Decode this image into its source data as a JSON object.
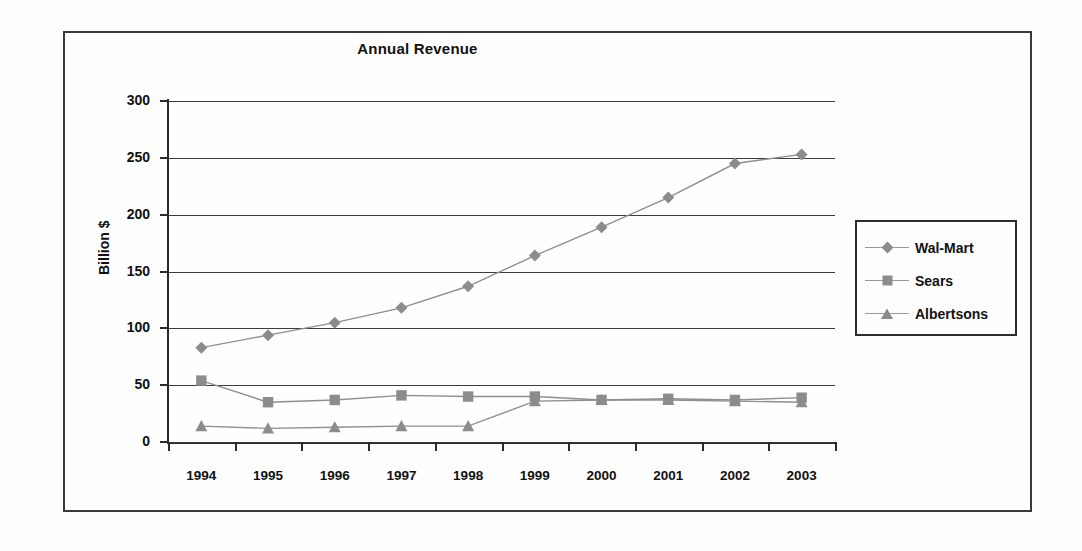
{
  "chart_data": {
    "type": "line",
    "title": "Annual Revenue",
    "xlabel": "",
    "ylabel": "Billion $",
    "categories": [
      "1994",
      "1995",
      "1996",
      "1997",
      "1998",
      "1999",
      "2000",
      "2001",
      "2002",
      "2003"
    ],
    "ylim": [
      0,
      300
    ],
    "yticks": [
      0,
      50,
      100,
      150,
      200,
      250,
      300
    ],
    "grid": true,
    "legend_position": "right",
    "series": [
      {
        "name": "Wal-Mart",
        "marker": "diamond",
        "color": "#8c8c8c",
        "values": [
          83,
          94,
          105,
          118,
          137,
          164,
          189,
          215,
          245,
          253
        ]
      },
      {
        "name": "Sears",
        "marker": "square",
        "color": "#8c8c8c",
        "values": [
          54,
          35,
          37,
          41,
          40,
          40,
          37,
          38,
          37,
          39
        ]
      },
      {
        "name": "Albertsons",
        "marker": "triangle",
        "color": "#8c8c8c",
        "values": [
          14,
          12,
          13,
          14,
          14,
          36,
          37,
          37,
          36,
          35
        ]
      }
    ]
  },
  "legend": {
    "items": [
      {
        "label": "Wal-Mart"
      },
      {
        "label": "Sears"
      },
      {
        "label": "Albertsons"
      }
    ]
  }
}
